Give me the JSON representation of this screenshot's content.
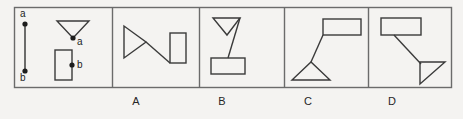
{
  "figure": {
    "type": "multiple-choice-geometry-figure",
    "stroke_color": "#3a3a3a",
    "background_color": "#f4f3f1",
    "frame": {
      "x": 14,
      "y": 7,
      "width": 438,
      "height": 81
    },
    "dividers_x": [
      112,
      199,
      284,
      368
    ],
    "prompt_panel": {
      "name": "prompt",
      "segment": {
        "label_top": "a",
        "label_bottom": "b",
        "x": 25,
        "y_top": 22,
        "y_bottom": 73
      },
      "triangle": {
        "orientation": "down",
        "vertex_label": "a",
        "points": "57,21 89,21 73,39"
      },
      "rectangle": {
        "orientation": "vertical",
        "vertex_label": "b",
        "x": 55,
        "y": 50,
        "width": 17,
        "height": 30,
        "dot_x": 72,
        "dot_y": 65
      }
    },
    "options": [
      {
        "id": "A",
        "label": "A",
        "label_x": 136,
        "triangle": {
          "orientation": "right",
          "points": "124,26 124,58 146,42"
        },
        "rectangle": {
          "orientation": "vertical",
          "x": 170,
          "y": 33,
          "width": 16,
          "height": 30
        },
        "connector": {
          "x1": 146,
          "y1": 42,
          "x2": 170,
          "y2": 63
        }
      },
      {
        "id": "B",
        "label": "B",
        "label_x": 222,
        "triangle": {
          "orientation": "down",
          "points": "213,18 240,18 227,35"
        },
        "rectangle": {
          "orientation": "horizontal",
          "x": 211,
          "y": 58,
          "width": 34,
          "height": 16
        },
        "connector": {
          "x1": 240,
          "y1": 18,
          "x2": 228,
          "y2": 58
        }
      },
      {
        "id": "C",
        "label": "C",
        "label_x": 308,
        "triangle": {
          "orientation": "up",
          "points": "292,80 330,80 311,62"
        },
        "rectangle": {
          "orientation": "horizontal",
          "x": 323,
          "y": 19,
          "width": 38,
          "height": 16
        },
        "connector": {
          "x1": 323,
          "y1": 35,
          "x2": 311,
          "y2": 62
        }
      },
      {
        "id": "D",
        "label": "D",
        "label_x": 392,
        "triangle": {
          "orientation": "right-down",
          "points": "420,62 445,62 420,84"
        },
        "rectangle": {
          "orientation": "horizontal",
          "x": 381,
          "y": 18,
          "width": 40,
          "height": 17
        },
        "connector": {
          "x1": 394,
          "y1": 35,
          "x2": 421,
          "y2": 64
        }
      }
    ]
  }
}
